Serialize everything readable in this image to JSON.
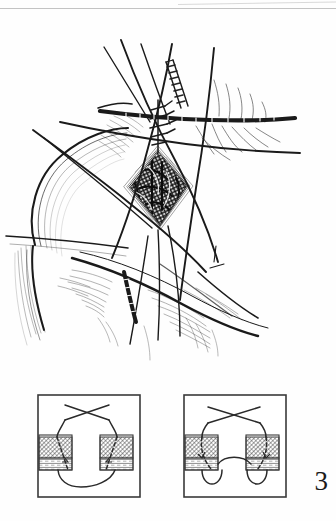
{
  "page": {
    "type": "surgical-illustration-plate",
    "background_color": "#fefefe",
    "ink_color": "#1a1a1a",
    "width": 336,
    "height": 521
  },
  "figure_number": "3",
  "artifacts": {
    "top_rule_label": "scan-edge-line",
    "top_rule_color": "#b9b9b9"
  },
  "main_illustration": {
    "name": "wound-closure-operative-view",
    "description": "Line drawing of an operative field on the shoulder/chest showing a diamond-shaped open incision held apart by traction sutures, with skin hooks, a retractor blade and subcutaneous tissue planes.",
    "elements": [
      {
        "name": "body-contour-shoulder",
        "kind": "outline"
      },
      {
        "name": "open-wound-diamond",
        "kind": "wound-cavity"
      },
      {
        "name": "wound-bed-dark-tissue",
        "kind": "shading"
      },
      {
        "name": "wound-edge-dermal-layer",
        "kind": "layered-edge"
      },
      {
        "name": "traction-suture-upper-left",
        "kind": "suture-strand"
      },
      {
        "name": "traction-suture-upper-right",
        "kind": "suture-strand"
      },
      {
        "name": "traction-suture-crossing",
        "kind": "suture-strand"
      },
      {
        "name": "traction-suture-lower",
        "kind": "suture-strand"
      },
      {
        "name": "retractor-blade",
        "kind": "instrument"
      },
      {
        "name": "clamp-jaw-horizontal",
        "kind": "instrument"
      },
      {
        "name": "subcutaneous-fat-hatching",
        "kind": "shading"
      },
      {
        "name": "skin-crease-lines",
        "kind": "shading"
      },
      {
        "name": "undermined-flap-edge",
        "kind": "outline"
      }
    ]
  },
  "schematic_panels": [
    {
      "name": "panel-left",
      "label": "",
      "description": "Cross-section schematic: two opposed tissue blocks with a suture passing deeply and the loop hanging low between them (untied / loose buried suture).",
      "parts": {
        "frame": "panel-border",
        "suture_crossing": "suture-cross-above",
        "suture_loop": "suture-loop-deep-low",
        "left_tissue_block": "tissue-block-left",
        "right_tissue_block": "tissue-block-right",
        "dermis_layer": "dermis-cross-hatched",
        "fat_layer": "fat-horizontal-lined",
        "needle_path": "needle-path-dashed"
      }
    },
    {
      "name": "panel-right",
      "label": "",
      "description": "Cross-section schematic: the same two tissue blocks with the suture tightened so the loop rises and the deep edges are drawn together (approximated / tied suture).",
      "parts": {
        "frame": "panel-border",
        "suture_crossing": "suture-cross-above",
        "suture_loop": "suture-loop-deep-raised",
        "left_tissue_block": "tissue-block-left",
        "right_tissue_block": "tissue-block-right",
        "dermis_layer": "dermis-cross-hatched",
        "fat_layer": "fat-horizontal-lined",
        "needle_path": "needle-path-dashed"
      }
    }
  ]
}
